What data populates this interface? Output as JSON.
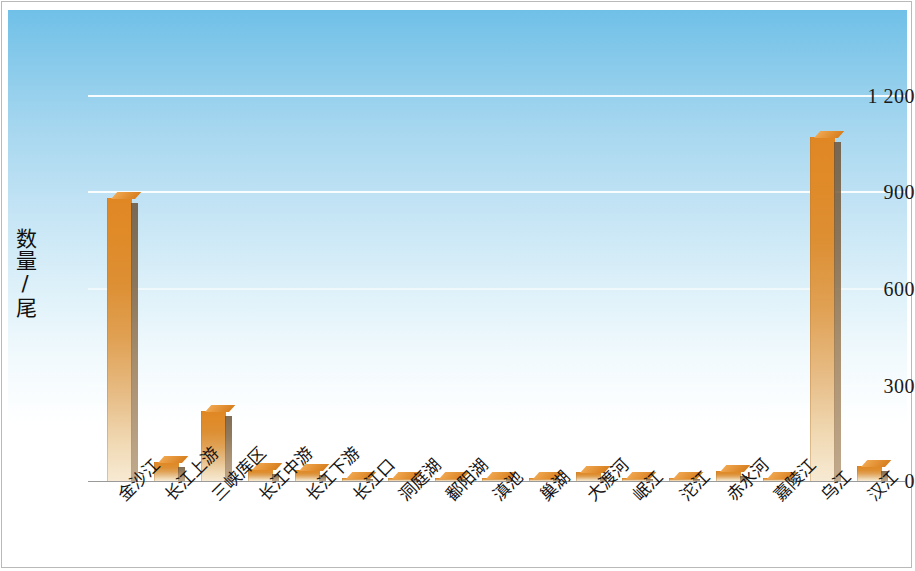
{
  "chart_data": {
    "type": "bar",
    "title": "",
    "xlabel": "",
    "ylabel": "数量/尾",
    "ylim": [
      0,
      1200
    ],
    "yticks": [
      "0",
      "300",
      "600",
      "900",
      "1 200"
    ],
    "ytick_values": [
      0,
      300,
      600,
      900,
      1200
    ],
    "grid": true,
    "legend": "none",
    "categories": [
      "金沙江",
      "长江上游",
      "三峡库区",
      "长江中游",
      "长江下游",
      "长江口",
      "洞庭湖",
      "鄱阳湖",
      "滇池",
      "巢湖",
      "大渡河",
      "岷江",
      "沱江",
      "赤水河",
      "嘉陵江",
      "乌江",
      "汉江"
    ],
    "values": [
      880,
      59,
      218,
      37,
      33,
      7,
      8,
      6,
      5,
      6,
      28,
      8,
      6,
      30,
      5,
      1070,
      46
    ]
  },
  "style": {
    "bar_color": "#e08a28",
    "bar_color_light": "#f4e0c0",
    "bar_side_color": "#7d6140",
    "plot_bg_top": "#6fc0e8",
    "plot_bg_bottom": "#ffffff",
    "gridline_color": "#ffffff",
    "axis_text_color": "#111111"
  }
}
